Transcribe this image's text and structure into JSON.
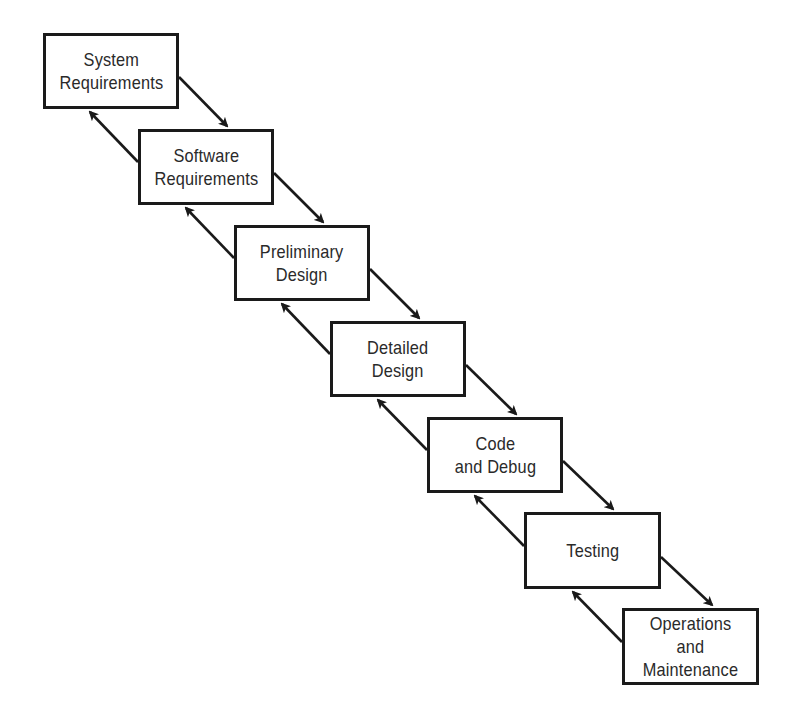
{
  "diagram": {
    "type": "waterfall-model",
    "colors": {
      "background": "#ffffff",
      "box_border": "#1a1a1a",
      "text": "#2a2a2a",
      "arrow": "#1a1a1a"
    },
    "stages": [
      {
        "id": "system-requirements",
        "label": "System\nRequirements",
        "x": 43,
        "y": 33,
        "w": 136,
        "h": 76
      },
      {
        "id": "software-requirements",
        "label": "Software\nRequirements",
        "x": 138,
        "y": 129,
        "w": 136,
        "h": 76
      },
      {
        "id": "preliminary-design",
        "label": "Preliminary\nDesign",
        "x": 234,
        "y": 225,
        "w": 136,
        "h": 76
      },
      {
        "id": "detailed-design",
        "label": "Detailed\nDesign",
        "x": 330,
        "y": 321,
        "w": 136,
        "h": 76
      },
      {
        "id": "code-and-debug",
        "label": "Code\nand Debug",
        "x": 427,
        "y": 417,
        "w": 136,
        "h": 76
      },
      {
        "id": "testing",
        "label": "Testing",
        "x": 524,
        "y": 512,
        "w": 137,
        "h": 77
      },
      {
        "id": "operations-and-maintenance",
        "label": "Operations\nand\nMaintenance",
        "x": 622,
        "y": 608,
        "w": 137,
        "h": 77
      }
    ],
    "forward_arrows": [
      {
        "from": "system-requirements",
        "to": "software-requirements",
        "x1": 179,
        "y1": 77,
        "x2": 227,
        "y2": 126
      },
      {
        "from": "software-requirements",
        "to": "preliminary-design",
        "x1": 274,
        "y1": 173,
        "x2": 323,
        "y2": 222
      },
      {
        "from": "preliminary-design",
        "to": "detailed-design",
        "x1": 370,
        "y1": 269,
        "x2": 419,
        "y2": 318
      },
      {
        "from": "detailed-design",
        "to": "code-and-debug",
        "x1": 466,
        "y1": 365,
        "x2": 516,
        "y2": 414
      },
      {
        "from": "code-and-debug",
        "to": "testing",
        "x1": 563,
        "y1": 461,
        "x2": 613,
        "y2": 509
      },
      {
        "from": "testing",
        "to": "operations-and-maintenance",
        "x1": 661,
        "y1": 557,
        "x2": 712,
        "y2": 605
      }
    ],
    "feedback_arrows": [
      {
        "from": "software-requirements",
        "to": "system-requirements",
        "x1": 138,
        "y1": 162,
        "x2": 90,
        "y2": 112
      },
      {
        "from": "preliminary-design",
        "to": "software-requirements",
        "x1": 234,
        "y1": 258,
        "x2": 186,
        "y2": 208
      },
      {
        "from": "detailed-design",
        "to": "preliminary-design",
        "x1": 330,
        "y1": 354,
        "x2": 282,
        "y2": 304
      },
      {
        "from": "code-and-debug",
        "to": "detailed-design",
        "x1": 427,
        "y1": 450,
        "x2": 378,
        "y2": 400
      },
      {
        "from": "testing",
        "to": "code-and-debug",
        "x1": 524,
        "y1": 546,
        "x2": 475,
        "y2": 496
      },
      {
        "from": "operations-and-maintenance",
        "to": "testing",
        "x1": 622,
        "y1": 642,
        "x2": 573,
        "y2": 592
      }
    ]
  }
}
